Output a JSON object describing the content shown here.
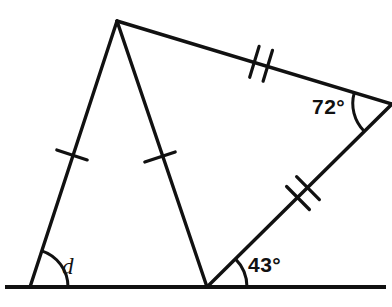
{
  "figure": {
    "stroke_color": "#111111",
    "background_color": "#ffffff",
    "canvas": {
      "width": 392,
      "height": 307
    }
  },
  "points": {
    "apex": {
      "name": "apex-vertex",
      "x": 117,
      "y": 21
    },
    "left_base": {
      "name": "left-base-vertex",
      "x": 30,
      "y": 287
    },
    "mid_base": {
      "name": "middle-base-vertex",
      "x": 207,
      "y": 287
    },
    "right": {
      "name": "right-vertex",
      "x": 391,
      "y": 104
    },
    "baseline_start": {
      "name": "baseline-left-end",
      "x": 5,
      "y": 287
    },
    "baseline_end": {
      "name": "baseline-right-end",
      "x": 386,
      "y": 287
    }
  },
  "segments": [
    {
      "id": "seg-left-side",
      "from": "left_base",
      "to": "apex",
      "ticks": 1
    },
    {
      "id": "seg-median",
      "from": "apex",
      "to": "mid_base",
      "ticks": 1
    },
    {
      "id": "seg-top-right",
      "from": "apex",
      "to": "right",
      "ticks": 2
    },
    {
      "id": "seg-lower-right",
      "from": "right",
      "to": "mid_base",
      "ticks": 2
    },
    {
      "id": "seg-baseline",
      "from": "baseline_start",
      "to": "baseline_end",
      "ticks": 0
    }
  ],
  "labels": {
    "angle_d": "d",
    "angle_43": "43°",
    "angle_72": "72°"
  },
  "angles": [
    {
      "id": "angle-left-base",
      "label_key": "angle_d",
      "vertex": "left_base",
      "value": "d"
    },
    {
      "id": "angle-mid-base",
      "label_key": "angle_43",
      "vertex": "mid_base",
      "value": "43°"
    },
    {
      "id": "angle-right-vertex",
      "label_key": "angle_72",
      "vertex": "right",
      "value": "72°"
    }
  ],
  "tick_marks": {
    "single": [
      {
        "id": "tick-left-side",
        "x": 72,
        "y": 155
      },
      {
        "id": "tick-median",
        "x": 160,
        "y": 157
      }
    ],
    "double": [
      {
        "id": "tick-top-right",
        "x": 261,
        "y": 63
      },
      {
        "id": "tick-lower-right",
        "x": 298,
        "y": 196
      }
    ]
  }
}
